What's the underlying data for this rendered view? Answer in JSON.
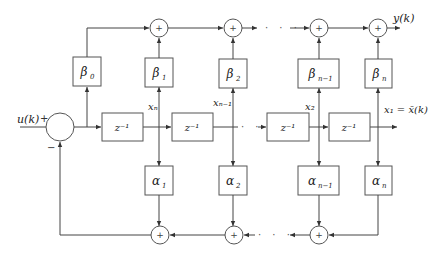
{
  "diagram": {
    "type": "block-diagram",
    "input": {
      "label": "u(k)",
      "plus_sign": "+",
      "minus_sign": "−"
    },
    "output": {
      "label": "y(k)"
    },
    "state_output": {
      "label": "x₁ = x̄(k)"
    },
    "delay_blocks": [
      {
        "label": "z⁻¹"
      },
      {
        "label": "z⁻¹"
      },
      {
        "label": "z⁻¹"
      },
      {
        "label": "z⁻¹"
      }
    ],
    "state_labels": [
      "xₙ",
      "xₙ₋₁",
      "x₂"
    ],
    "beta_blocks": [
      {
        "label": "β",
        "sub": "0"
      },
      {
        "label": "β",
        "sub": "1"
      },
      {
        "label": "β",
        "sub": "2"
      },
      {
        "label": "β",
        "sub": "n−1"
      },
      {
        "label": "β",
        "sub": "n"
      }
    ],
    "alpha_blocks": [
      {
        "label": "α",
        "sub": "1"
      },
      {
        "label": "α",
        "sub": "2"
      },
      {
        "label": "α",
        "sub": "n−1"
      },
      {
        "label": "α",
        "sub": "n"
      }
    ],
    "sum_symbol": "+",
    "ellipsis": "· · ·"
  }
}
